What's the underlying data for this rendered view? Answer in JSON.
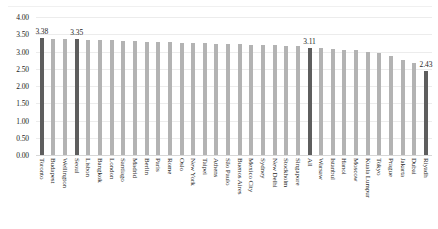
{
  "chart_data": {
    "type": "bar",
    "title": "",
    "subtitle": "",
    "xlabel": "",
    "ylabel": "",
    "ylim": [
      0,
      4
    ],
    "grid": true,
    "legend": "none",
    "y_ticks": [
      "0.00",
      "0.50",
      "1.00",
      "1.50",
      "2.00",
      "2.50",
      "3.00",
      "3.50",
      "4.00"
    ],
    "y_tick_values": [
      0,
      0.5,
      1,
      1.5,
      2,
      2.5,
      3,
      3.5,
      4
    ],
    "categories": [
      "Toronto",
      "Budapest",
      "Wellington",
      "Seoul",
      "Lisbon",
      "Bangkok",
      "London",
      "Santiago",
      "Madrid",
      "Berlin",
      "Paris",
      "Rome",
      "Oslo",
      "New York",
      "Taipei",
      "Athens",
      "São Paulo",
      "Buenos Aires",
      "Mexico City",
      "Sydney",
      "New Delhi",
      "Stockholm",
      "Singapore",
      "All",
      "Warsaw",
      "Istanbul",
      "Hanoi",
      "Moscow",
      "Kuala Lumpur",
      "Tokyo",
      "Prague",
      "Jakarta",
      "Dubai",
      "Riyadh"
    ],
    "values": [
      3.38,
      3.36,
      3.36,
      3.35,
      3.34,
      3.33,
      3.32,
      3.31,
      3.3,
      3.29,
      3.28,
      3.27,
      3.26,
      3.25,
      3.24,
      3.23,
      3.22,
      3.21,
      3.2,
      3.19,
      3.18,
      3.17,
      3.15,
      3.11,
      3.09,
      3.07,
      3.05,
      3.03,
      3.0,
      2.96,
      2.86,
      2.76,
      2.66,
      2.43
    ],
    "labeled_points": [
      {
        "category": "Toronto",
        "label": "3.38"
      },
      {
        "category": "Seoul",
        "label": "3.35"
      },
      {
        "category": "All",
        "label": "3.11"
      },
      {
        "category": "Riyadh",
        "label": "2.43"
      }
    ],
    "highlighted": [
      "Toronto",
      "Seoul",
      "All",
      "Riyadh"
    ],
    "colors": {
      "bar": "#b3b3b3",
      "bar_highlight": "#5e5e5e",
      "grid": "#ececec",
      "baseline": "#d7d7d7",
      "text": "#1c1c1c",
      "background": "#ffffff"
    }
  }
}
